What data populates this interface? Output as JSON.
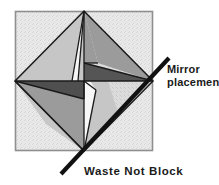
{
  "figure": {
    "name": "waste-not-block-mirror-diagram",
    "title": "Waste Not Block",
    "mirror_label_line1": "Mirror",
    "mirror_label_line2": "placement",
    "block_label": "Waste Not Block",
    "colors": {
      "background": "#ffffff",
      "block_field": "#e8e8e8",
      "block_field_speckle": "#d8d8d8",
      "block_border": "#8f8f8f",
      "light_gray": "#c9c9c9",
      "medium_gray": "#9a9a9a",
      "dark_gray": "#5a5a5a",
      "white_patch": "#f7f7f7",
      "line": "#1a1a1a",
      "mirror_line": "#111111",
      "text": "#1a1a1a"
    },
    "block_square": {
      "x": 15,
      "y": 11,
      "width": 138,
      "height": 140
    },
    "diamond_vertices": {
      "top": [
        84,
        11
      ],
      "right": [
        153,
        81
      ],
      "bottom": [
        84,
        151
      ],
      "left": [
        15,
        81
      ]
    },
    "mirror_line": {
      "x1": 61,
      "y1": 174,
      "x2": 169,
      "y2": 58,
      "stroke_width": 4.2,
      "label_leader": true
    },
    "patches": [
      {
        "name": "top-left-large-light-triangle",
        "shade": "light_gray"
      },
      {
        "name": "top-left-white-wedge",
        "shade": "white_patch"
      },
      {
        "name": "top-right-medium-triangle",
        "shade": "medium_gray"
      },
      {
        "name": "top-right-light-triangle",
        "shade": "light_gray"
      },
      {
        "name": "center-right-dark-triangle",
        "shade": "dark_gray"
      },
      {
        "name": "center-left-dark-triangle",
        "shade": "dark_gray"
      },
      {
        "name": "bottom-left-medium-triangle",
        "shade": "medium_gray"
      },
      {
        "name": "bottom-left-light-triangle",
        "shade": "light_gray"
      },
      {
        "name": "bottom-right-white-wedge",
        "shade": "white_patch"
      },
      {
        "name": "bottom-right-light-triangle",
        "shade": "light_gray"
      }
    ]
  }
}
